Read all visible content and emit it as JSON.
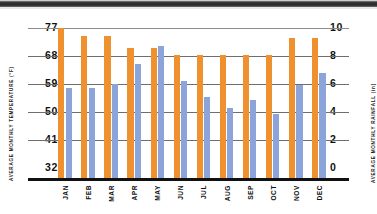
{
  "chart_data": {
    "type": "bar",
    "title": "",
    "subtitle": "",
    "categories": [
      "JAN",
      "FEB",
      "MAR",
      "APR",
      "MAY",
      "JUN",
      "JUL",
      "AUG",
      "SEP",
      "OCT",
      "NOV",
      "DEC"
    ],
    "series": [
      {
        "name": "Average Monthly Temperature",
        "axis": "left",
        "unit": "°F",
        "color": "#f0912f",
        "values": [
          77,
          74.5,
          74.5,
          71,
          71,
          69,
          69,
          69,
          69,
          69,
          74,
          74
        ]
      },
      {
        "name": "Average Monthly Rainfall",
        "axis": "right",
        "unit": "in",
        "color": "#8ba5da",
        "values": [
          6.0,
          6.0,
          6.3,
          7.6,
          8.8,
          6.5,
          5.4,
          4.7,
          5.2,
          4.3,
          6.2,
          7.0
        ]
      }
    ],
    "left_axis": {
      "label": "AVERAGE MONTHLY TEMPERATURE (°F)",
      "ticks": [
        "77",
        "68",
        "59",
        "50",
        "41",
        "32"
      ],
      "min": 32,
      "max": 77
    },
    "right_axis": {
      "label": "AVERAGE MONTHLY RAINFALL (in)",
      "ticks": [
        "10",
        "8",
        "6",
        "4",
        "2",
        "0"
      ],
      "min": 0,
      "max": 10
    },
    "grid": true,
    "legend": "none",
    "xlabel": "",
    "ylabel": "AVERAGE MONTHLY TEMPERATURE (°F)"
  },
  "colors": {
    "temperature_bar": "#f0912f",
    "rainfall_bar": "#8ba5da",
    "gridline": "#6f6f6f",
    "axis": "#111111",
    "background": "#ffffff"
  }
}
